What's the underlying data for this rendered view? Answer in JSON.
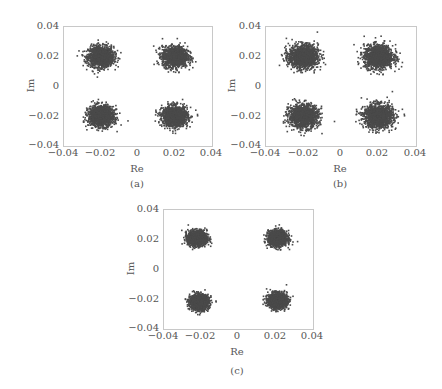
{
  "chart_data": [
    {
      "type": "scatter",
      "title": "",
      "caption": "(a)",
      "xlabel": "Re",
      "ylabel": "Im",
      "xlim": [
        -0.04,
        0.04
      ],
      "ylim": [
        -0.04,
        0.04
      ],
      "xticks": [
        "-0.04",
        "-0.02",
        "0",
        "0.02",
        "0.04"
      ],
      "yticks": [
        "0.04",
        "0.02",
        "0",
        "-0.02",
        "-0.04"
      ],
      "grid": false,
      "series": [
        {
          "name": "constellation",
          "clusters": [
            {
              "center": [
                -0.02,
                0.02
              ],
              "spread": 0.0075
            },
            {
              "center": [
                0.02,
                0.02
              ],
              "spread": 0.0075
            },
            {
              "center": [
                -0.02,
                -0.02
              ],
              "spread": 0.0075
            },
            {
              "center": [
                0.02,
                -0.02
              ],
              "spread": 0.0075
            }
          ],
          "color": "#4a4a4a"
        }
      ]
    },
    {
      "type": "scatter",
      "title": "",
      "caption": "(b)",
      "xlabel": "Re",
      "ylabel": "Im",
      "xlim": [
        -0.04,
        0.04
      ],
      "ylim": [
        -0.04,
        0.04
      ],
      "xticks": [
        "-0.04",
        "-0.02",
        "0",
        "0.02",
        "0.04"
      ],
      "yticks": [
        "0.04",
        "0.02",
        "0",
        "-0.02",
        "-0.04"
      ],
      "grid": false,
      "series": [
        {
          "name": "constellation",
          "clusters": [
            {
              "center": [
                -0.02,
                0.02
              ],
              "spread": 0.0085
            },
            {
              "center": [
                0.02,
                0.02
              ],
              "spread": 0.0085
            },
            {
              "center": [
                -0.02,
                -0.02
              ],
              "spread": 0.0085
            },
            {
              "center": [
                0.02,
                -0.02
              ],
              "spread": 0.0085
            }
          ],
          "color": "#4a4a4a"
        }
      ]
    },
    {
      "type": "scatter",
      "title": "",
      "caption": "(c)",
      "xlabel": "Re",
      "ylabel": "Im",
      "xlim": [
        -0.04,
        0.04
      ],
      "ylim": [
        -0.04,
        0.04
      ],
      "xticks": [
        "-0.04",
        "-0.02",
        "0",
        "0.02",
        "0.04"
      ],
      "yticks": [
        "0.04",
        "0.02",
        "0",
        "-0.02",
        "-0.04"
      ],
      "grid": false,
      "series": [
        {
          "name": "constellation",
          "clusters": [
            {
              "center": [
                -0.022,
                0.021
              ],
              "spread": 0.0055
            },
            {
              "center": [
                0.021,
                0.021
              ],
              "spread": 0.0055
            },
            {
              "center": [
                -0.021,
                -0.022
              ],
              "spread": 0.0055
            },
            {
              "center": [
                0.021,
                -0.021
              ],
              "spread": 0.0055
            }
          ],
          "color": "#4a4a4a"
        }
      ]
    }
  ],
  "panels": [
    {
      "caption": "(a)",
      "xlabel": "Re",
      "ylabel": "Im",
      "xticks": [
        "−0.04",
        "−0.02",
        "0",
        "0.02",
        "0.04"
      ],
      "yticks": [
        "0.04",
        "0.02",
        "0",
        "−0.02",
        "−0.04"
      ]
    },
    {
      "caption": "(b)",
      "xlabel": "Re",
      "ylabel": "Im",
      "xticks": [
        "−0.04",
        "−0.02",
        "0",
        "0.02",
        "0.04"
      ],
      "yticks": [
        "0.04",
        "0.02",
        "0",
        "−0.02",
        "−0.04"
      ]
    },
    {
      "caption": "(c)",
      "xlabel": "Re",
      "ylabel": "Im",
      "xticks": [
        "−0.04",
        "−0.02",
        "0",
        "0.02",
        "0.04"
      ],
      "yticks": [
        "0.04",
        "0.02",
        "0",
        "−0.02",
        "−0.04"
      ]
    }
  ]
}
